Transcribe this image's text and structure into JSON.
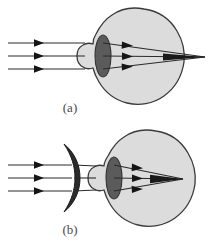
{
  "figure": {
    "panels": [
      {
        "id": "a",
        "caption": "(a)",
        "caption_x": 70,
        "caption_y": 112,
        "description": "Uncorrected farsighted eye: parallel rays converge behind the retina",
        "has_corrective_lens": false,
        "focus_beyond_retina": true
      },
      {
        "id": "b",
        "caption": "(b)",
        "caption_x": 70,
        "caption_y": 234,
        "description": "Corrected eye: converging spectacle lens brings rays to focus on the retina",
        "has_corrective_lens": true,
        "focus_beyond_retina": false
      }
    ]
  },
  "colors": {
    "background": "#ffffff",
    "eyeball_fill": "#dcdcdc",
    "eyeball_stroke": "#3a3a3a",
    "eye_lens_fill": "#5b5b5b",
    "eye_lens_stroke": "#333333",
    "corrective_lens_fill": "#2b2b2b",
    "corrective_lens_stroke": "#1a1a1a",
    "ray_stroke": "#2a2a2a",
    "caption_text": "#4a4a4a"
  },
  "geometry": {
    "panel_width": 217,
    "panel_height": 122,
    "eye_center_x": 138,
    "eye_center_y": 56,
    "eye_radius": 44,
    "eye_lens_cx": 103,
    "eye_lens_cy": 56,
    "eye_lens_rx": 8,
    "eye_lens_ry": 21,
    "retina_x": 172,
    "ray_start_x": 8,
    "ray_ys": [
      43,
      56,
      69
    ],
    "focus_a_x": 205,
    "focus_b_x": 172,
    "corrective_lens_x": 72,
    "corrective_lens_cy": 56
  },
  "rays": {
    "count": 3,
    "arrowheads_left": 3,
    "arrowheads_inner": 3,
    "label": "parallel incoming light rays"
  }
}
